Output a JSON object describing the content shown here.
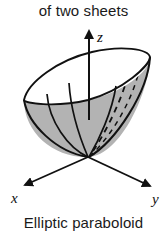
{
  "figure": {
    "caption_top": "of two sheets",
    "caption_bottom": "Elliptic paraboloid",
    "axes": {
      "z_label": "z",
      "x_label": "x",
      "y_label": "y"
    },
    "colors": {
      "outline": "#111111",
      "surface_fill": "#b3b3b3",
      "rim_fill": "#ffffff",
      "text": "#1a1a1a",
      "background": "#ffffff"
    },
    "shape": {
      "name": "elliptic-paraboloid",
      "description": "Open upward bowl with tilted elliptical rim, shaded interior, dashed hidden edges"
    }
  }
}
